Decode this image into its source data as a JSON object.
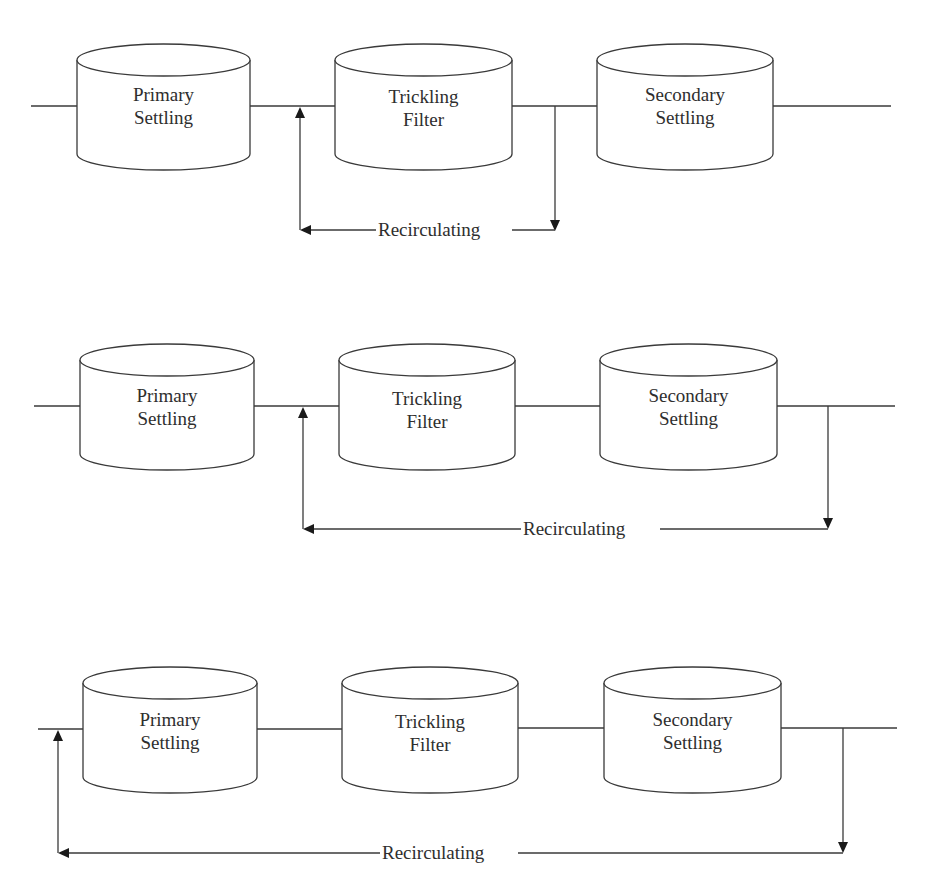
{
  "figure": {
    "type": "process-flow-diagrams",
    "diagrams": [
      {
        "id": "diagram-1",
        "description": "Recirculation from trickling filter effluent to trickling filter influent",
        "units": [
          {
            "name": "primary-settling",
            "label_line1": "Primary",
            "label_line2": "Settling"
          },
          {
            "name": "trickling-filter",
            "label_line1": "Trickling",
            "label_line2": "Filter"
          },
          {
            "name": "secondary-settling",
            "label_line1": "Secondary",
            "label_line2": "Settling"
          }
        ],
        "recirculation": {
          "label": "Recirculating",
          "from": "after trickling filter",
          "to": "before trickling filter"
        }
      },
      {
        "id": "diagram-2",
        "description": "Recirculation from secondary settling effluent to trickling filter influent",
        "units": [
          {
            "name": "primary-settling",
            "label_line1": "Primary",
            "label_line2": "Settling"
          },
          {
            "name": "trickling-filter",
            "label_line1": "Trickling",
            "label_line2": "Filter"
          },
          {
            "name": "secondary-settling",
            "label_line1": "Secondary",
            "label_line2": "Settling"
          }
        ],
        "recirculation": {
          "label": "Recirculating",
          "from": "after secondary settling",
          "to": "before trickling filter"
        }
      },
      {
        "id": "diagram-3",
        "description": "Recirculation from secondary settling effluent to primary settling influent",
        "units": [
          {
            "name": "primary-settling",
            "label_line1": "Primary",
            "label_line2": "Settling"
          },
          {
            "name": "trickling-filter",
            "label_line1": "Trickling",
            "label_line2": "Filter"
          },
          {
            "name": "secondary-settling",
            "label_line1": "Secondary",
            "label_line2": "Settling"
          }
        ],
        "recirculation": {
          "label": "Recirculating",
          "from": "after secondary settling",
          "to": "before primary settling"
        }
      }
    ],
    "colors": {
      "line": "#3a3a3a",
      "text": "#2e2e2e",
      "background": "#ffffff"
    }
  }
}
